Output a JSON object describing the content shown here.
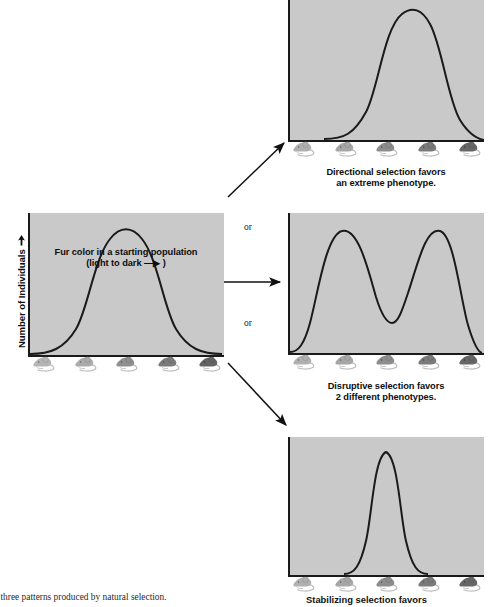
{
  "figure": {
    "title_hidden": "Three patterns produced by natural selection",
    "axis": {
      "y_label": "Number of Individuals",
      "y_arrow": "up-arrow"
    }
  },
  "connectors": {
    "or_top": "or",
    "or_bottom": "or",
    "arrow_up": "diagonal-arrow-up-right",
    "arrow_mid": "arrow-right",
    "arrow_down": "diagonal-arrow-down-right"
  },
  "panels": [
    {
      "id": "starting-population",
      "caption_line1": "Fur color in a starting population",
      "caption_line2": "(light to dark —▶ )",
      "mice_shades": [
        "#b5b5b5",
        "#ababab",
        "#8f8f8f",
        "#7b7b7b",
        "#636363"
      ],
      "plot_bg": "#c9c9c9"
    },
    {
      "id": "directional-selection",
      "caption_line1": "Directional selection favors",
      "caption_line2": "an extreme phenotype.",
      "mice_shades": [
        "#b0b0b0",
        "#a6a6a6",
        "#8d8d8d",
        "#7a7a7a",
        "#666666"
      ],
      "plot_bg": "#c9c9c9"
    },
    {
      "id": "disruptive-selection",
      "caption_line1": "Disruptive selection favors",
      "caption_line2": "2 different phenotypes.",
      "mice_shades": [
        "#b0b0b0",
        "#a6a6a6",
        "#8d8d8d",
        "#7a7a7a",
        "#666666"
      ],
      "plot_bg": "#c9c9c9"
    },
    {
      "id": "stabilizing-selection",
      "caption_line1": "Stabilizing selection favors",
      "caption_line2": "an intermediate phenotype.",
      "mice_shades": [
        "#b0b0b0",
        "#a6a6a6",
        "#8d8d8d",
        "#7a7a7a",
        "#666666"
      ],
      "plot_bg": "#c9c9c9"
    }
  ],
  "footer": {
    "left": "e three patterns produced by natural selection.",
    "right": "Stabilizing selection favors"
  },
  "chart_data": [
    {
      "type": "line",
      "id": "starting-population",
      "title": "Fur color in a starting population",
      "xlabel": "Fur color (light to dark)",
      "ylabel": "Number of Individuals",
      "distribution": "normal",
      "mean": 0.5,
      "sd": 0.145,
      "peak_height": 0.88,
      "xlim": [
        0,
        1
      ],
      "ylim": [
        0,
        1
      ],
      "grid": false,
      "x": [
        0.0,
        0.05,
        0.1,
        0.15,
        0.2,
        0.25,
        0.3,
        0.35,
        0.4,
        0.45,
        0.5,
        0.55,
        0.6,
        0.65,
        0.7,
        0.75,
        0.8,
        0.85,
        0.9,
        0.95,
        1.0
      ],
      "y": [
        0.01,
        0.02,
        0.04,
        0.08,
        0.16,
        0.28,
        0.45,
        0.64,
        0.8,
        0.87,
        0.88,
        0.86,
        0.78,
        0.62,
        0.43,
        0.26,
        0.14,
        0.07,
        0.03,
        0.015,
        0.01
      ]
    },
    {
      "type": "line",
      "id": "directional-selection",
      "title": "Directional selection favors an extreme phenotype.",
      "xlabel": "Fur color (light to dark)",
      "ylabel": "Number of Individuals",
      "distribution": "normal-shifted-right",
      "mean": 0.62,
      "sd": 0.155,
      "peak_height": 0.95,
      "xlim": [
        0,
        1
      ],
      "ylim": [
        0,
        1
      ],
      "grid": false,
      "x": [
        0.0,
        0.05,
        0.1,
        0.15,
        0.2,
        0.25,
        0.3,
        0.35,
        0.4,
        0.45,
        0.5,
        0.55,
        0.6,
        0.65,
        0.7,
        0.75,
        0.8,
        0.85,
        0.9,
        0.95,
        1.0
      ],
      "y": [
        0.0,
        0.0,
        0.01,
        0.02,
        0.04,
        0.09,
        0.17,
        0.3,
        0.48,
        0.68,
        0.85,
        0.94,
        0.95,
        0.88,
        0.73,
        0.54,
        0.36,
        0.21,
        0.11,
        0.05,
        0.02
      ]
    },
    {
      "type": "line",
      "id": "disruptive-selection",
      "title": "Disruptive selection favors 2 different phenotypes.",
      "xlabel": "Fur color (light to dark)",
      "ylabel": "Number of Individuals",
      "distribution": "bimodal",
      "modes": [
        0.27,
        0.74
      ],
      "valley": 0.5,
      "peak_height": 0.92,
      "valley_height": 0.25,
      "xlim": [
        0,
        1
      ],
      "ylim": [
        0,
        1
      ],
      "grid": false,
      "x": [
        0.0,
        0.05,
        0.1,
        0.15,
        0.2,
        0.25,
        0.3,
        0.35,
        0.4,
        0.45,
        0.5,
        0.55,
        0.6,
        0.65,
        0.7,
        0.75,
        0.8,
        0.85,
        0.9,
        0.95,
        1.0
      ],
      "y": [
        0.02,
        0.07,
        0.25,
        0.58,
        0.83,
        0.92,
        0.9,
        0.75,
        0.52,
        0.32,
        0.25,
        0.32,
        0.54,
        0.78,
        0.9,
        0.92,
        0.8,
        0.52,
        0.22,
        0.07,
        0.02
      ]
    },
    {
      "type": "line",
      "id": "stabilizing-selection",
      "title": "Stabilizing selection favors an intermediate phenotype.",
      "xlabel": "Fur color (light to dark)",
      "ylabel": "Number of Individuals",
      "distribution": "narrow-normal",
      "mean": 0.5,
      "sd": 0.075,
      "peak_height": 0.93,
      "xlim": [
        0,
        1
      ],
      "ylim": [
        0,
        1
      ],
      "grid": false,
      "x": [
        0.0,
        0.05,
        0.1,
        0.15,
        0.2,
        0.25,
        0.3,
        0.35,
        0.4,
        0.45,
        0.5,
        0.55,
        0.6,
        0.65,
        0.7,
        0.75,
        0.8,
        0.85,
        0.9,
        0.95,
        1.0
      ],
      "y": [
        0.01,
        0.01,
        0.01,
        0.01,
        0.02,
        0.04,
        0.1,
        0.3,
        0.64,
        0.88,
        0.93,
        0.88,
        0.64,
        0.3,
        0.1,
        0.04,
        0.02,
        0.01,
        0.01,
        0.01,
        0.01
      ]
    }
  ]
}
